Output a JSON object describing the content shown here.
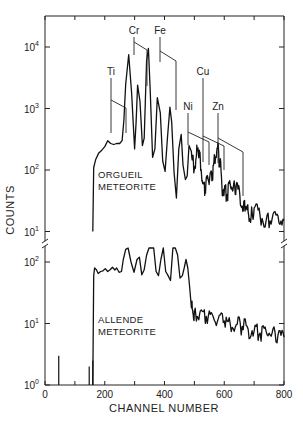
{
  "chart_data": {
    "type": "line",
    "title": "",
    "xlabel": "CHANNEL NUMBER",
    "ylabel": "COUNTS",
    "xlim": [
      0,
      800
    ],
    "x_ticks": [
      0,
      200,
      400,
      600,
      800
    ],
    "x_minor_ticks": [
      100,
      300,
      500,
      700
    ],
    "yscale": "log",
    "panels": [
      {
        "name": "ORGUEIL METEORITE",
        "label_lines": [
          "ORGUEIL",
          "METEORITE"
        ],
        "ylim": [
          10,
          30000
        ],
        "y_ticks": [
          {
            "value": 10,
            "label": "10",
            "exp": "1"
          },
          {
            "value": 100,
            "label": "10",
            "exp": "2"
          },
          {
            "value": 1000,
            "label": "10",
            "exp": "3"
          },
          {
            "value": 10000,
            "label": "10",
            "exp": "4"
          }
        ],
        "series": {
          "x": [
            160,
            163,
            170,
            180,
            190,
            200,
            210,
            220,
            230,
            240,
            250,
            258,
            264,
            270,
            280,
            290,
            300,
            305,
            310,
            318,
            326,
            332,
            340,
            346,
            352,
            360,
            368,
            376,
            386,
            394,
            402,
            410,
            418,
            424,
            432,
            440,
            448,
            456,
            462,
            470,
            476,
            482,
            490,
            498,
            506,
            512,
            520,
            528,
            536,
            544,
            552,
            560,
            568,
            576,
            584,
            592,
            600,
            610,
            620,
            630,
            640,
            652,
            664,
            672,
            680,
            690,
            700,
            720,
            740,
            760,
            780,
            800
          ],
          "y": [
            10,
            110,
            150,
            190,
            210,
            240,
            300,
            270,
            260,
            270,
            270,
            300,
            650,
            2500,
            7500,
            1800,
            220,
            600,
            2400,
            1300,
            250,
            330,
            6000,
            9500,
            2000,
            160,
            220,
            1500,
            850,
            140,
            95,
            340,
            1050,
            600,
            90,
            35,
            220,
            380,
            120,
            70,
            80,
            250,
            200,
            90,
            160,
            230,
            150,
            60,
            50,
            80,
            80,
            70,
            160,
            230,
            140,
            55,
            45,
            40,
            60,
            50,
            55,
            40,
            22,
            25,
            20,
            17,
            24,
            18,
            15,
            16,
            18,
            15
          ]
        },
        "peaks": [
          {
            "element": "Ti",
            "channel": 230,
            "counts": 300
          },
          {
            "element": "Cr",
            "channel": 290,
            "counts": 7500
          },
          {
            "element": "Cr",
            "channel": 346,
            "counts": 2400
          },
          {
            "element": "Fe",
            "channel": 386,
            "counts": 6000
          },
          {
            "element": "Fe",
            "channel": 440,
            "counts": 1050
          },
          {
            "element": "Ni",
            "channel": 482,
            "counts": 380
          },
          {
            "element": "Cu",
            "channel": 528,
            "counts": 250
          },
          {
            "element": "Zn",
            "channel": 576,
            "counts": 230
          },
          {
            "element": "Zn",
            "channel": 664,
            "counts": 65
          }
        ]
      },
      {
        "name": "ALLENDE METEORITE",
        "label_lines": [
          "ALLENDE",
          "METEORITE"
        ],
        "ylim": [
          1,
          250
        ],
        "y_ticks": [
          {
            "value": 1,
            "label": "10",
            "exp": "0"
          },
          {
            "value": 10,
            "label": "10",
            "exp": "1"
          },
          {
            "value": 100,
            "label": "10",
            "exp": "2"
          }
        ],
        "series": {
          "x": [
            160,
            163,
            166,
            172,
            178,
            186,
            194,
            202,
            210,
            218,
            226,
            234,
            240,
            248,
            256,
            262,
            270,
            278,
            288,
            298,
            308,
            316,
            324,
            332,
            340,
            348,
            356,
            364,
            372,
            380,
            388,
            396,
            404,
            412,
            420,
            428,
            436,
            444,
            452,
            460,
            466,
            472,
            478,
            484,
            490,
            496,
            504,
            520,
            540,
            560,
            580,
            600,
            620,
            640,
            660,
            680,
            700,
            720,
            740,
            760,
            780,
            800
          ],
          "y": [
            1,
            60,
            80,
            75,
            65,
            70,
            72,
            78,
            70,
            75,
            82,
            74,
            80,
            68,
            70,
            110,
            160,
            280,
            100,
            68,
            110,
            120,
            62,
            75,
            130,
            380,
            600,
            180,
            70,
            60,
            110,
            240,
            70,
            60,
            50,
            180,
            330,
            130,
            55,
            60,
            80,
            110,
            80,
            40,
            18,
            14,
            15,
            16,
            13,
            14,
            12,
            11,
            10,
            9.5,
            9,
            8,
            7.5,
            7,
            7.5,
            7,
            6.5,
            6
          ]
        },
        "spikes": [
          {
            "channel": 46,
            "counts": 3
          },
          {
            "channel": 148,
            "counts": 2
          },
          {
            "channel": 160,
            "counts": 2.5
          }
        ]
      }
    ],
    "annotations": [
      "Ti",
      "Cr",
      "Fe",
      "Ni",
      "Cu",
      "Zn"
    ],
    "grid": false,
    "legend": "none"
  }
}
